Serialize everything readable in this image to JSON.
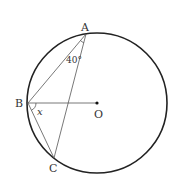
{
  "diagram": {
    "type": "circle-geometry",
    "circle": {
      "cx": 97,
      "cy": 103,
      "r": 70,
      "stroke": "#222222"
    },
    "points": {
      "A": {
        "x": 86,
        "y": 34,
        "label": "A"
      },
      "B": {
        "x": 28,
        "y": 103,
        "label": "B"
      },
      "C": {
        "x": 54,
        "y": 158,
        "label": "C"
      },
      "O": {
        "x": 97,
        "y": 103,
        "label": "O"
      }
    },
    "segments": [
      "AB",
      "AC",
      "BC",
      "BO"
    ],
    "angles": {
      "BAC": {
        "label": "40°"
      },
      "OBC": {
        "label": "x"
      }
    }
  }
}
